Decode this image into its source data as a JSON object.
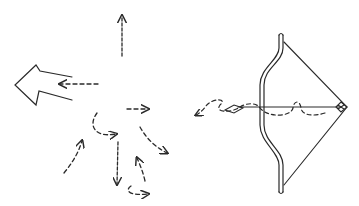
{
  "figure": {
    "stroke_color": "#2a2a2a",
    "background": "#ffffff"
  },
  "left_panel": {
    "big_arrow": {
      "direction": "left",
      "style": "outline"
    },
    "dashed_arrows": [
      {
        "id": "up",
        "direction": "up"
      },
      {
        "id": "left",
        "direction": "left"
      },
      {
        "id": "right-short",
        "direction": "right"
      },
      {
        "id": "curl",
        "direction": "right"
      },
      {
        "id": "diag-down-right",
        "direction": "down-right"
      },
      {
        "id": "diag-up",
        "direction": "up-right"
      },
      {
        "id": "down",
        "direction": "down"
      },
      {
        "id": "up-small",
        "direction": "up"
      },
      {
        "id": "hook-right",
        "direction": "right"
      }
    ]
  },
  "right_panel": {
    "bow": {
      "orientation": "vertical",
      "drawn": true
    },
    "arrow": {
      "direction": "left"
    },
    "trajectory": {
      "style": "dashed-wavy",
      "direction": "left"
    }
  }
}
